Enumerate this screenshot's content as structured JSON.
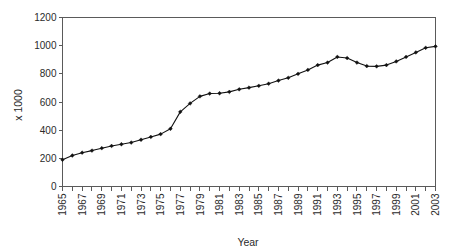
{
  "chart_data": {
    "type": "line",
    "title": "",
    "xlabel": "Year",
    "ylabel": "x 1000",
    "ylim": [
      0,
      1200
    ],
    "xlim": [
      1965,
      2003
    ],
    "y_ticks": [
      0,
      200,
      400,
      600,
      800,
      1000,
      1200
    ],
    "y_tick_labels": [
      "0",
      "200",
      "400",
      "600",
      "800",
      "1000",
      "1200"
    ],
    "x_tick_labels": [
      "1965",
      "1967",
      "1969",
      "1971",
      "1973",
      "1975",
      "1977",
      "1979",
      "1981",
      "1983",
      "1985",
      "1987",
      "1989",
      "1991",
      "1993",
      "1995",
      "1997",
      "1999",
      "2001",
      "2003"
    ],
    "grid": false,
    "legend": "none",
    "marker": "diamond",
    "line_color": "#111111",
    "axis_color": "#5a5a5a",
    "x": [
      1965,
      1966,
      1967,
      1968,
      1969,
      1970,
      1971,
      1972,
      1973,
      1974,
      1975,
      1976,
      1977,
      1978,
      1979,
      1980,
      1981,
      1982,
      1983,
      1984,
      1985,
      1986,
      1987,
      1988,
      1989,
      1990,
      1991,
      1992,
      1993,
      1994,
      1995,
      1996,
      1997,
      1998,
      1999,
      2000,
      2001,
      2002,
      2003
    ],
    "values": [
      190,
      220,
      240,
      255,
      272,
      288,
      300,
      312,
      332,
      352,
      372,
      410,
      530,
      590,
      640,
      660,
      662,
      672,
      690,
      702,
      715,
      730,
      752,
      772,
      800,
      828,
      862,
      880,
      920,
      912,
      880,
      855,
      853,
      862,
      888,
      920,
      952,
      985,
      995
    ],
    "series": [
      {
        "name": "series-1",
        "values": [
          190,
          220,
          240,
          255,
          272,
          288,
          300,
          312,
          332,
          352,
          372,
          410,
          530,
          590,
          640,
          660,
          662,
          672,
          690,
          702,
          715,
          730,
          752,
          772,
          800,
          828,
          862,
          880,
          920,
          912,
          880,
          855,
          853,
          862,
          888,
          920,
          952,
          985,
          995
        ]
      }
    ]
  }
}
